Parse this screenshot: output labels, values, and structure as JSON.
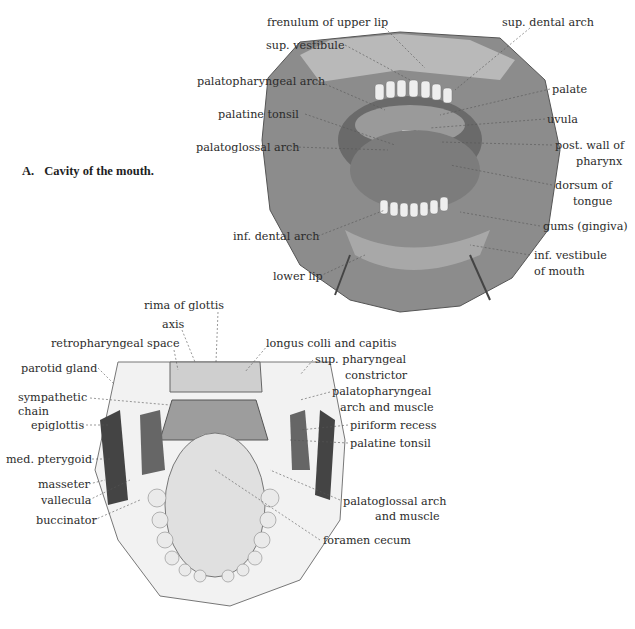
{
  "figure_a": {
    "letter": "A.",
    "caption": "Cavity of the mouth.",
    "labels": {
      "frenulum_upper_lip": "frenulum of upper lip",
      "sup_dental_arch": "sup. dental arch",
      "sup_vestibule": "sup. vestibule",
      "palatopharyngeal_arch": "palatopharyngeal arch",
      "palate": "palate",
      "palatine_tonsil": "palatine tonsil",
      "uvula": "uvula",
      "palatoglossal_arch": "palatoglossal arch",
      "post_wall_pharynx_1": "post. wall of",
      "post_wall_pharynx_2": "pharynx",
      "dorsum_tongue_1": "dorsum of",
      "dorsum_tongue_2": "tongue",
      "gums": "gums (gingiva)",
      "inf_dental_arch": "inf. dental arch",
      "inf_vestibule_1": "inf. vestibule",
      "inf_vestibule_2": "of mouth",
      "lower_lip": "lower lip"
    }
  },
  "figure_b": {
    "labels": {
      "rima_glottis": "rima of glottis",
      "axis": "axis",
      "retropharyngeal_space": "retropharyngeal space",
      "longus_colli": "longus colli and capitis",
      "parotid_gland": "parotid gland",
      "sup_pharyngeal_1": "sup. pharyngeal",
      "sup_pharyngeal_2": "constrictor",
      "sympathetic_1": "sympathetic",
      "sympathetic_2": "chain",
      "palatopharyngeal_1": "palatopharyngeal",
      "palatopharyngeal_2": "arch and muscle",
      "epiglottis": "epiglottis",
      "piriform_recess": "piriform recess",
      "palatine_tonsil": "palatine tonsil",
      "med_pterygoid": "med. pterygoid",
      "masseter": "masseter",
      "vallecula": "vallecula",
      "buccinator": "buccinator",
      "palatoglossal_1": "palatoglossal arch",
      "palatoglossal_2": "and muscle",
      "foramen_cecum": "foramen  cecum"
    }
  }
}
